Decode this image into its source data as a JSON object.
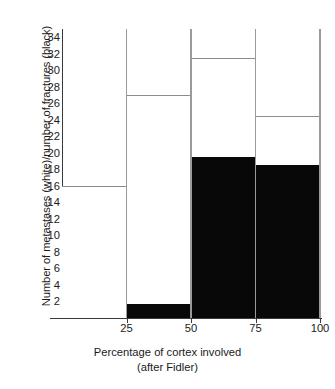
{
  "chart_data": {
    "type": "bar",
    "title": "",
    "xlabel": "Percentage of cortex involved",
    "xlabel_sub": "(after Fidler)",
    "ylabel": "Number of metastases (white)/number of fractures (black)",
    "categories": [
      "0-25",
      "25-50",
      "50-75",
      "75-100"
    ],
    "x_tick_labels": [
      "25",
      "50",
      "75",
      "100"
    ],
    "x_tick_values": [
      25,
      50,
      75,
      100
    ],
    "xlim": [
      0,
      100
    ],
    "ylim": [
      0,
      35
    ],
    "y_tick_labels": [
      "2",
      "4",
      "6",
      "8",
      "10",
      "12",
      "14",
      "16",
      "18",
      "20",
      "22",
      "24",
      "26",
      "28",
      "30",
      "32",
      "34"
    ],
    "y_tick_values": [
      2,
      4,
      6,
      8,
      10,
      12,
      14,
      16,
      18,
      20,
      22,
      24,
      26,
      28,
      30,
      32,
      34
    ],
    "grid": false,
    "legend": "inline-in-axis-label",
    "series": [
      {
        "name": "Number of metastases (white)",
        "color": "#ffffff",
        "edge_color": "#8c8c8c",
        "values": [
          16,
          27,
          31.5,
          24.5
        ]
      },
      {
        "name": "Number of fractures (black)",
        "color": "#080808",
        "edge_color": "#080808",
        "values": [
          0,
          1.7,
          19.5,
          18.5
        ]
      }
    ],
    "bin_edges": [
      0,
      25,
      50,
      75,
      100
    ]
  }
}
